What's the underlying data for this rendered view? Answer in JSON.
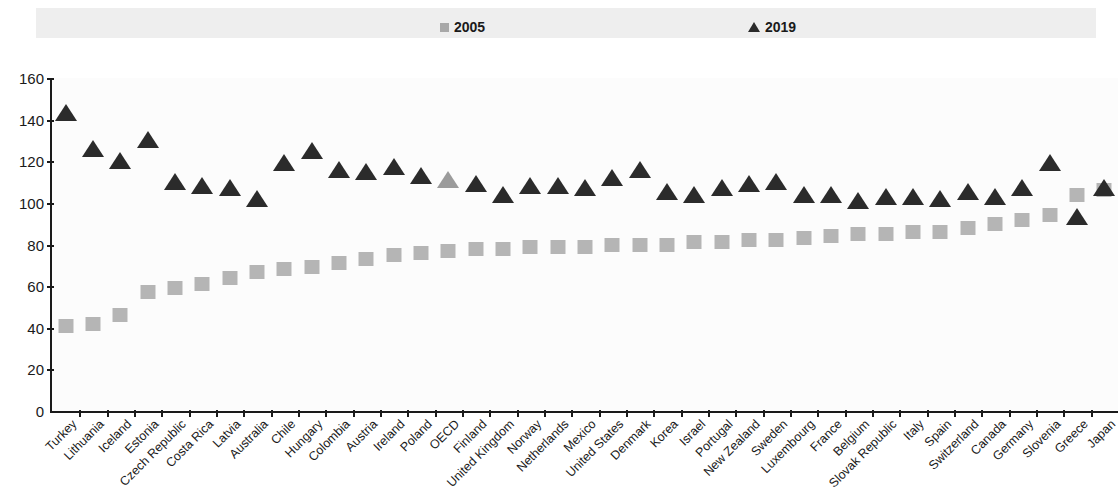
{
  "legend": {
    "items": [
      {
        "label": "2005",
        "marker": "square-icon",
        "color": "#a8a8a8"
      },
      {
        "label": "2019",
        "marker": "triangle-icon",
        "color": "#2b2b2b"
      }
    ]
  },
  "axis": {
    "y_ticks": [
      "0",
      "20",
      "40",
      "60",
      "80",
      "100",
      "120",
      "140",
      "160"
    ]
  },
  "chart_data": {
    "type": "scatter",
    "title": "",
    "subtitle": "",
    "xlabel": "",
    "ylabel": "",
    "ylim": [
      0,
      160
    ],
    "ytick_step": 20,
    "grid": false,
    "legend_position": "top",
    "highlight_category": "OECD",
    "highlight_color": "#9b9b9b",
    "categories": [
      "Turkey",
      "Lithuania",
      "Iceland",
      "Estonia",
      "Czech Republic",
      "Costa Rica",
      "Latvia",
      "Australia",
      "Chile",
      "Hungary",
      "Colombia",
      "Austria",
      "Ireland",
      "Poland",
      "OECD",
      "Finland",
      "United Kingdom",
      "Norway",
      "Netherlands",
      "Mexico",
      "United States",
      "Denmark",
      "Korea",
      "Israel",
      "Portugal",
      "New Zealand",
      "Sweden",
      "Luxembourg",
      "France",
      "Belgium",
      "Slovak Republic",
      "Italy",
      "Spain",
      "Switzerland",
      "Canada",
      "Germany",
      "Slovenia",
      "Greece",
      "Japan"
    ],
    "series": [
      {
        "name": "2005",
        "marker": "square",
        "color": "#b5b5b5",
        "values": [
          41,
          42,
          46,
          57,
          59,
          61,
          64,
          67,
          68,
          69,
          71,
          73,
          75,
          76,
          77,
          78,
          78,
          79,
          79,
          79,
          80,
          80,
          80,
          81,
          81,
          82,
          82,
          83,
          84,
          85,
          85,
          86,
          86,
          88,
          90,
          92,
          94,
          104,
          106
        ]
      },
      {
        "name": "2019",
        "marker": "triangle",
        "color": "#2b2b2b",
        "values": [
          143,
          126,
          120,
          130,
          110,
          108,
          107,
          102,
          119,
          125,
          116,
          115,
          117,
          113,
          111,
          109,
          104,
          108,
          108,
          107,
          112,
          116,
          105,
          104,
          107,
          109,
          110,
          104,
          104,
          101,
          103,
          103,
          102,
          105,
          103,
          107,
          119,
          93,
          107
        ]
      }
    ]
  }
}
